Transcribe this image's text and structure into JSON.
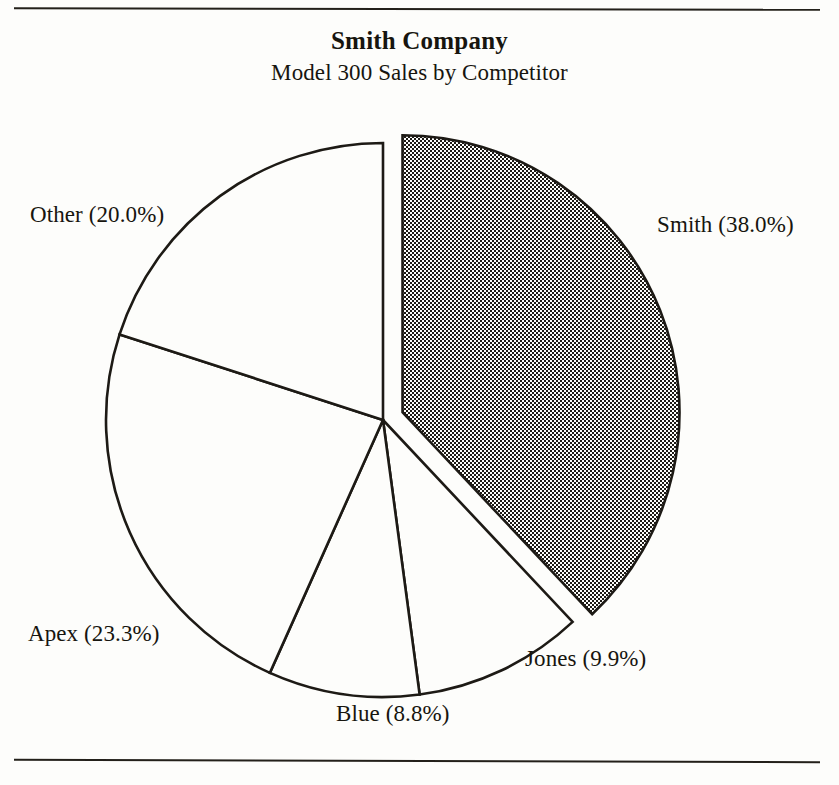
{
  "figure": {
    "title": "Smith Company",
    "subtitle": "Model 300 Sales by Competitor",
    "rule_color": "#23201a",
    "background": "#fdfdfb",
    "ink_color": "#1d1a15"
  },
  "labels": {
    "smith": "Smith (38.0%)",
    "other": "Other (20.0%)",
    "apex": "Apex (23.3%)",
    "blue": "Blue (8.8%)",
    "jones": "Jones (9.9%)"
  },
  "chart_data": {
    "type": "pie",
    "title": "Smith Company",
    "subtitle": "Model 300 Sales by Competitor",
    "xlabel": "",
    "ylabel": "",
    "units": "percent",
    "total": 100.0,
    "start_angle_deg": 0,
    "direction": "clockwise",
    "legend": "none-labels-outside",
    "categories": [
      "Smith",
      "Jones",
      "Blue",
      "Apex",
      "Other"
    ],
    "values": [
      38.0,
      9.9,
      8.8,
      23.3,
      20.0
    ],
    "slices": [
      {
        "name": "Smith",
        "value": 38.0,
        "label": "Smith (38.0%)",
        "fill": "halftone-gray",
        "exploded": true,
        "start_deg": 0.0,
        "end_deg": 136.8
      },
      {
        "name": "Jones",
        "value": 9.9,
        "label": "Jones (9.9%)",
        "fill": "white",
        "exploded": false,
        "start_deg": 136.8,
        "end_deg": 172.4
      },
      {
        "name": "Blue",
        "value": 8.8,
        "label": "Blue (8.8%)",
        "fill": "white",
        "exploded": false,
        "start_deg": 172.4,
        "end_deg": 204.1
      },
      {
        "name": "Apex",
        "value": 23.3,
        "label": "Apex (23.3%)",
        "fill": "white",
        "exploded": false,
        "start_deg": 204.1,
        "end_deg": 288.0
      },
      {
        "name": "Other",
        "value": 20.0,
        "label": "Other (20.0%)",
        "fill": "white",
        "exploded": false,
        "start_deg": 288.0,
        "end_deg": 360.0
      }
    ]
  },
  "geometry": {
    "center_x": 383,
    "center_y": 420,
    "radius": 277,
    "explode_offset": 21
  }
}
